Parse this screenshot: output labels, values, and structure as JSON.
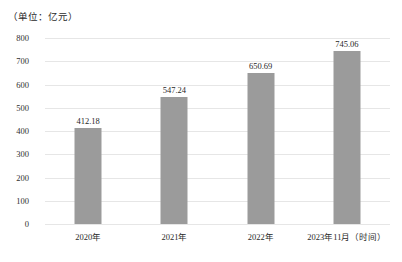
{
  "chart_data": {
    "type": "bar",
    "title": "",
    "subtitle": "",
    "unit_caption": "（单位：亿元）",
    "categories": [
      "2020年",
      "2021年",
      "2022年",
      "2023年11月（时间）"
    ],
    "values": [
      412.18,
      547.24,
      650.69,
      745.06
    ],
    "value_labels": [
      "412.18",
      "547.24",
      "650.69",
      "745.06"
    ],
    "xlabel": "时间",
    "ylabel": "亿元",
    "ylim": [
      0,
      800
    ],
    "yticks": [
      800,
      700,
      600,
      500,
      400,
      300,
      200,
      100,
      0
    ],
    "ytick_labels": [
      "800",
      "700",
      "600",
      "500",
      "400",
      "300",
      "200",
      "100",
      "0"
    ],
    "grid": true,
    "grid_axis": "y",
    "legend": false,
    "legend_position": "none",
    "colors": {
      "bar": "#9b9b9b",
      "gridline": "#e6e6e6",
      "text": "#2a2a2a",
      "background": "#ffffff"
    }
  }
}
